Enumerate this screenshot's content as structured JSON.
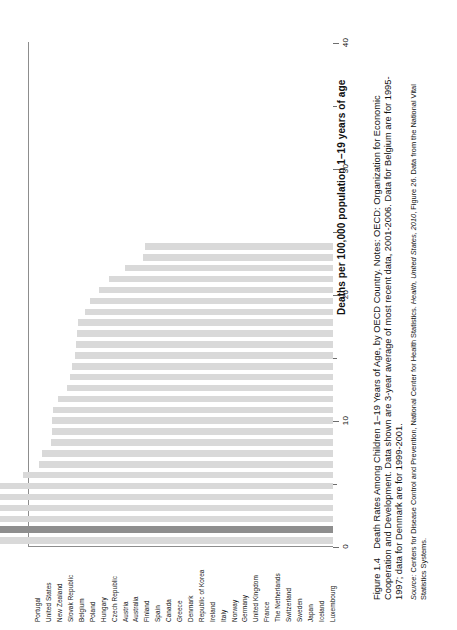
{
  "figure": {
    "number": "Figure 1.4",
    "caption_lines": [
      "Death Rates Among Children 1–19 Years of Age, by OECD Country. Notes: OECD: Organization for Economic",
      "Cooperation and Development. Data shown are 3-year average of most recent data, 2001-2006. Data for Belgium are for 1995-",
      "1997; data for Denmark are for 1999-2001."
    ],
    "source_lines": [
      "Source: Centers for Disease Control and Prevention, National Center for Health Statistics. Health, United States, 2010, Figure 26. Data from the National Vital",
      "Statistics Systems."
    ],
    "source_prefix": "Source:",
    "source_italic_a": "Health, United States, 2010"
  },
  "chart_data": {
    "type": "bar",
    "title": "Death Rates Among Children 1–19 Years of Age, by OECD Country",
    "orientation": "rotated-90",
    "xlabel": "",
    "ylabel": "Deaths per 100,000 population 1–19 years of age",
    "ylim": [
      0,
      40
    ],
    "yticks": [
      0,
      10,
      20,
      30,
      40
    ],
    "ytick_labels": [
      "0",
      "10",
      "20",
      "30",
      "40"
    ],
    "grid": false,
    "highlight_category": "United States",
    "bar_color": "#d9d9d9",
    "highlight_color": "#8e8e8e",
    "categories": [
      "Portugal",
      "United States",
      "New Zealand",
      "Slovak Republic",
      "Belgium",
      "Poland",
      "Hungary",
      "Czech Republic",
      "Austria",
      "Australia",
      "Finland",
      "Spain",
      "Canada",
      "Greece",
      "Denmark",
      "Republic of Korea",
      "Ireland",
      "Italy",
      "Norway",
      "Germany",
      "United Kingdom",
      "France",
      "The Netherlands",
      "Switzerland",
      "Sweden",
      "Japan",
      "Iceland",
      "Luxembourg"
    ],
    "values": [
      36.0,
      33.6,
      32.8,
      30.4,
      28.9,
      27.8,
      24.6,
      23.3,
      23.1,
      22.4,
      22.3,
      22.3,
      22.2,
      21.8,
      21.1,
      20.9,
      20.7,
      20.5,
      20.4,
      20.3,
      20.2,
      19.7,
      19.3,
      18.6,
      17.8,
      16.5,
      15.1,
      14.9
    ]
  }
}
